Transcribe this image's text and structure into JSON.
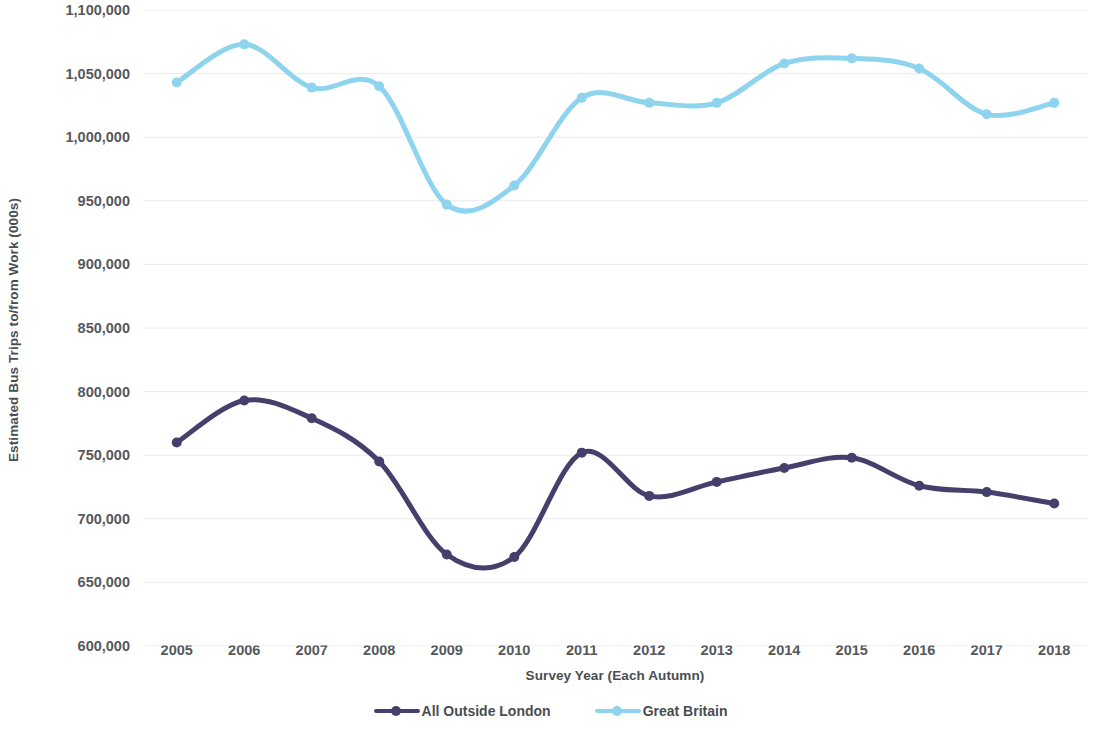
{
  "chart_data": {
    "type": "line",
    "title": "",
    "xlabel": "Survey Year (Each Autumn)",
    "ylabel": "Estimated Bus Trips to/from Work (000s)",
    "categories": [
      "2005",
      "2006",
      "2007",
      "2008",
      "2009",
      "2010",
      "2011",
      "2012",
      "2013",
      "2014",
      "2015",
      "2016",
      "2017",
      "2018"
    ],
    "x": [
      2005,
      2006,
      2007,
      2008,
      2009,
      2010,
      2011,
      2012,
      2013,
      2014,
      2015,
      2016,
      2017,
      2018
    ],
    "series": [
      {
        "name": "All Outside London",
        "color": "#45406b",
        "values": [
          760000,
          793000,
          779000,
          745000,
          672000,
          670000,
          752000,
          718000,
          729000,
          740000,
          748000,
          726000,
          721000,
          712000
        ]
      },
      {
        "name": "Great Britain",
        "color": "#8fd4ee",
        "values": [
          1043000,
          1073000,
          1039000,
          1040000,
          947000,
          962000,
          1031000,
          1027000,
          1027000,
          1058000,
          1062000,
          1054000,
          1018000,
          1027000
        ]
      }
    ],
    "ylim": [
      600000,
      1100000
    ],
    "ytick_values": [
      600000,
      650000,
      700000,
      750000,
      800000,
      850000,
      900000,
      950000,
      1000000,
      1050000,
      1100000
    ],
    "ytick_labels": [
      "600,000",
      "650,000",
      "700,000",
      "750,000",
      "800,000",
      "850,000",
      "900,000",
      "950,000",
      "1,000,000",
      "1,050,000",
      "1,100,000"
    ],
    "grid": true,
    "grid_color": "#e9eaec",
    "legend_position": "bottom",
    "smoothing": "spline"
  },
  "legend": {
    "items": [
      {
        "label": "All Outside London",
        "color": "#45406b"
      },
      {
        "label": "Great Britain",
        "color": "#8fd4ee"
      }
    ]
  }
}
